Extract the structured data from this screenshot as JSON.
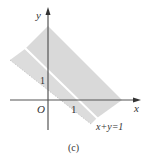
{
  "figure": {
    "caption": "(c)",
    "axes": {
      "x_label": "x",
      "y_label": "y",
      "origin_label": "O",
      "x_tick_label": "1",
      "y_tick_label": "1"
    },
    "line_label": "x+y=1",
    "colors": {
      "region_fill": "#d9d9d9",
      "axis": "#444444",
      "boundary_line": "#ffffff",
      "text": "#333333"
    }
  }
}
